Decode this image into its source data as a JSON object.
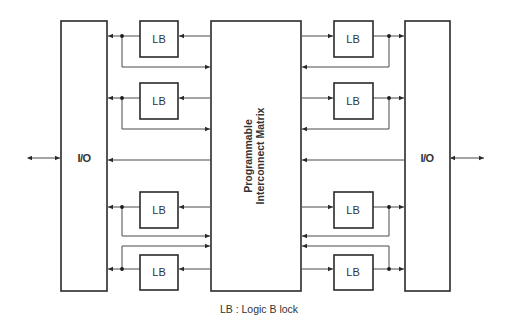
{
  "diagram": {
    "io_left": {
      "label": "I/O"
    },
    "io_right": {
      "label": "I/O"
    },
    "matrix": {
      "line1": "Programmable",
      "line2": "Interconnect Matrix"
    },
    "logic_blocks": {
      "left": [
        {
          "label": "LB"
        },
        {
          "label": "LB"
        },
        {
          "label": "LB"
        },
        {
          "label": "LB"
        }
      ],
      "right": [
        {
          "label": "LB"
        },
        {
          "label": "LB"
        },
        {
          "label": "LB"
        },
        {
          "label": "LB"
        }
      ]
    },
    "legend": "LB : Logic B lock",
    "colors": {
      "stroke": "#2a2a2a",
      "wire": "#4a4a4a",
      "background": "#ffffff"
    }
  }
}
